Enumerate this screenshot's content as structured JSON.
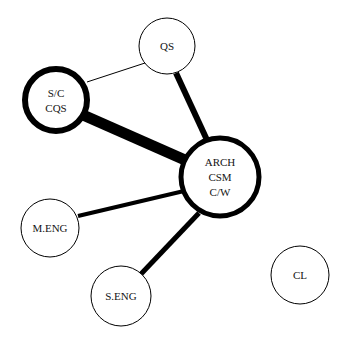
{
  "diagram": {
    "type": "network-graph",
    "title": "",
    "background_color": "#ffffff",
    "node_fill_color": "#ffffff",
    "node_stroke_color": "#000000",
    "edge_color": "#000000",
    "label_color": "#141414",
    "nodes": [
      {
        "id": "qs",
        "label_lines": [
          "QS"
        ],
        "label": "QS",
        "cx": 167,
        "cy": 46,
        "r": 28,
        "stroke_width": 1,
        "emphasis": "normal",
        "font_size": 11
      },
      {
        "id": "sc_cqs",
        "label_lines": [
          "S/C",
          "CQS"
        ],
        "label": "S/C CQS",
        "cx": 56,
        "cy": 100,
        "r": 31,
        "stroke_width": 6,
        "emphasis": "heavy",
        "font_size": 11
      },
      {
        "id": "arch_csm_cw",
        "label_lines": [
          "ARCH",
          "CSM",
          "C/W"
        ],
        "label": "ARCH CSM C/W",
        "cx": 220,
        "cy": 177,
        "r": 39,
        "stroke_width": 5,
        "emphasis": "heavy",
        "font_size": 11
      },
      {
        "id": "m_eng",
        "label_lines": [
          "M.ENG"
        ],
        "label": "M.ENG",
        "cx": 50,
        "cy": 228,
        "r": 29,
        "stroke_width": 1,
        "emphasis": "normal",
        "font_size": 11
      },
      {
        "id": "s_eng",
        "label_lines": [
          "S.ENG"
        ],
        "label": "S.ENG",
        "cx": 121,
        "cy": 296,
        "r": 30,
        "stroke_width": 1,
        "emphasis": "normal",
        "font_size": 11
      },
      {
        "id": "cl",
        "label_lines": [
          "CL"
        ],
        "label": "CL",
        "cx": 300,
        "cy": 275,
        "r": 29,
        "stroke_width": 1,
        "emphasis": "normal",
        "font_size": 11
      }
    ],
    "edges": [
      {
        "id": "edge-sc-qs",
        "source": "sc_cqs",
        "target": "qs",
        "weight": "thin",
        "stroke_width": 1,
        "x1": 87,
        "y1": 82,
        "x2": 145,
        "y2": 63
      },
      {
        "id": "edge-sc-arch",
        "source": "sc_cqs",
        "target": "arch_csm_cw",
        "weight": "very-thick",
        "stroke_width": 11,
        "x1": 83,
        "y1": 115,
        "x2": 185,
        "y2": 160
      },
      {
        "id": "edge-qs-arch",
        "source": "qs",
        "target": "arch_csm_cw",
        "weight": "thick",
        "stroke_width": 6,
        "x1": 176,
        "y1": 73,
        "x2": 207,
        "y2": 140
      },
      {
        "id": "edge-meng-arch",
        "source": "m_eng",
        "target": "arch_csm_cw",
        "weight": "medium",
        "stroke_width": 4,
        "x1": 78,
        "y1": 216,
        "x2": 184,
        "y2": 191
      },
      {
        "id": "edge-seng-arch",
        "source": "s_eng",
        "target": "arch_csm_cw",
        "weight": "thick",
        "stroke_width": 5,
        "x1": 141,
        "y1": 274,
        "x2": 199,
        "y2": 213
      }
    ],
    "isolated_nodes": [
      "cl"
    ]
  }
}
